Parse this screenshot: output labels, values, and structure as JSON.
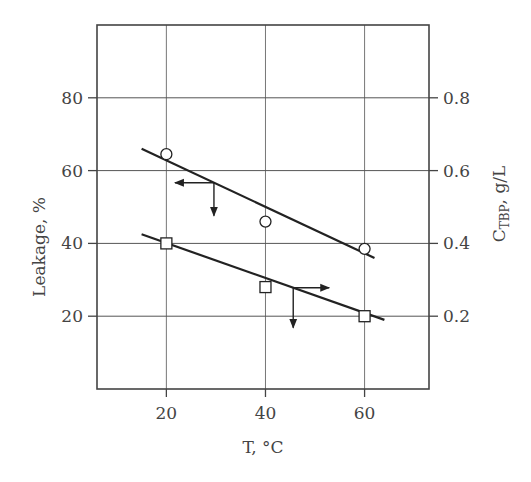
{
  "chart_data": {
    "type": "scatter",
    "title": "",
    "xlabel": "T, °C",
    "ylabel": "Leakage, %",
    "ylabel_right": "C_TBP, g/L",
    "ylabel_right_main": "C",
    "ylabel_right_sub": "TBP",
    "ylabel_right_tail": ", g/L",
    "xlim": [
      6,
      73
    ],
    "ylim": [
      0,
      100
    ],
    "ylim_right": [
      0,
      1.0
    ],
    "x_ticks": [
      20,
      40,
      60
    ],
    "x_tick_labels": [
      "20",
      "40",
      "60"
    ],
    "y_ticks": [
      20,
      40,
      60,
      80
    ],
    "y_tick_labels": [
      "20",
      "40",
      "60",
      "80"
    ],
    "y_right_ticks": [
      0.2,
      0.4,
      0.6,
      0.8
    ],
    "y_right_tick_labels": [
      "0.2",
      "0.4",
      "0.6",
      "0.8"
    ],
    "grid": true,
    "legend": null,
    "series": [
      {
        "name": "Leakage, %",
        "axis": "left",
        "marker": "circle",
        "x": [
          20,
          40,
          60
        ],
        "values": [
          64.5,
          46,
          38.5
        ],
        "fit_line": {
          "x": [
            15,
            62
          ],
          "y": [
            66,
            36
          ]
        },
        "axis_indicator": "left"
      },
      {
        "name": "C_TBP, g/L",
        "axis": "right",
        "marker": "square",
        "x": [
          20,
          40,
          60
        ],
        "values": [
          0.4,
          0.28,
          0.2
        ],
        "values_left_scale": [
          40,
          28,
          20
        ],
        "fit_line": {
          "x": [
            15,
            64
          ],
          "y": [
            42.5,
            19
          ]
        },
        "axis_indicator": "right"
      }
    ]
  }
}
